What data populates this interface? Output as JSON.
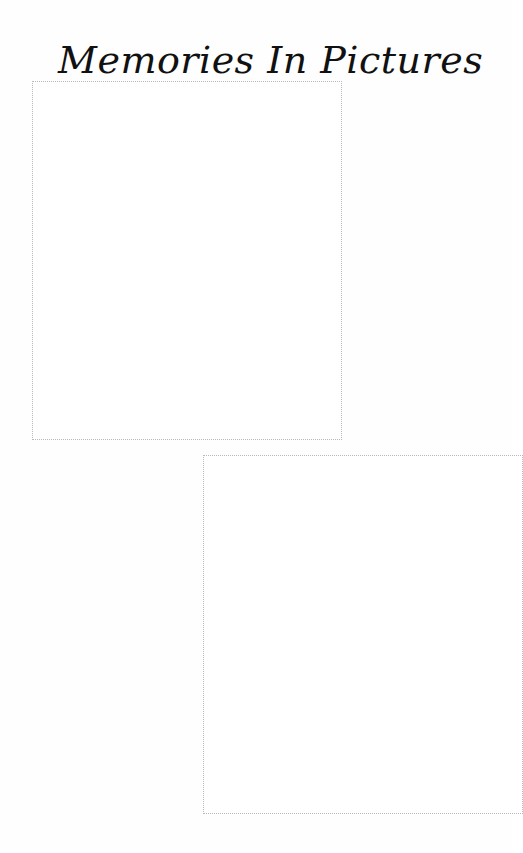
{
  "page": {
    "title": "Memories In Pictures",
    "photo_frames": [
      {
        "label": "",
        "content": "empty"
      },
      {
        "label": "",
        "content": "empty"
      }
    ]
  },
  "colors": {
    "background": "#fefefe",
    "title_text": "#111111",
    "frame_border": "#b8b8b8"
  }
}
